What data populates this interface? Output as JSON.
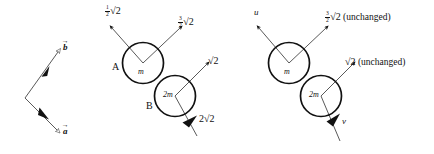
{
  "figure": {
    "width": 434,
    "height": 154,
    "background_color": "#ffffff",
    "ink_color": "#111111"
  },
  "panels": {
    "vectors": {
      "name": "vector-key-panel",
      "labels": {
        "b": "b",
        "a": "a",
        "accent": "→"
      }
    },
    "before": {
      "name": "before-collision-panel",
      "body_a": {
        "tag": "A",
        "mass": "m",
        "velocity_left": {
          "fraction_numerator": "1",
          "fraction_denominator": "2",
          "radical": "√2"
        },
        "velocity_right": {
          "fraction_numerator": "3",
          "fraction_denominator": "2",
          "radical": "√2"
        }
      },
      "body_b": {
        "tag": "B",
        "mass": "2m",
        "velocity_upper_right": "√2",
        "velocity_lower_left": "2√2"
      }
    },
    "after": {
      "name": "after-collision-panel",
      "body_a": {
        "mass": "m",
        "velocity_left": "u",
        "velocity_right": {
          "fraction_numerator": "3",
          "fraction_denominator": "2",
          "radical": "√2",
          "note": "(unchanged)"
        }
      },
      "body_b": {
        "mass": "2m",
        "velocity_upper_right": {
          "radical": "√2",
          "note": "(unchanged)"
        },
        "velocity_lower_right": "v"
      }
    }
  }
}
